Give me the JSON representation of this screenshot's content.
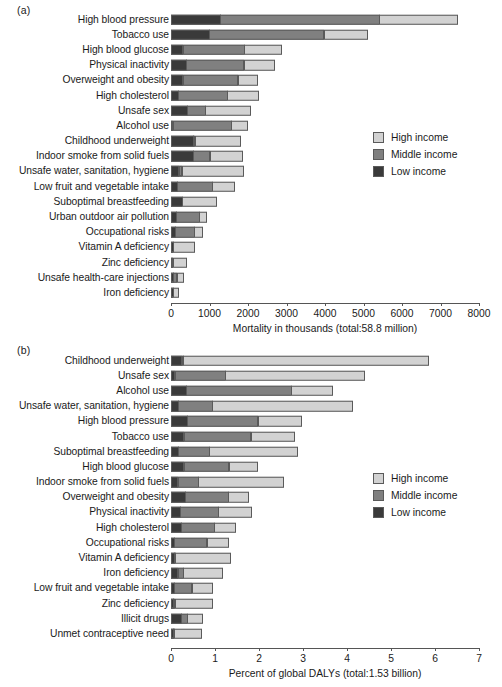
{
  "figure": {
    "panels": [
      {
        "letter": "(a)",
        "axis_title": "Mortality in thousands (total:58.8 million)",
        "xlim": [
          0,
          8000
        ],
        "ticks": [
          0,
          1000,
          2000,
          3000,
          4000,
          5000,
          6000,
          7000,
          8000
        ],
        "tick_labels": [
          "0",
          "1000",
          "2000",
          "3000",
          "4000",
          "5000",
          "6000",
          "7000",
          "8000"
        ]
      },
      {
        "letter": "(b)",
        "axis_title": "Percent of global DALYs (total:1.53 billion)",
        "xlim": [
          0,
          7
        ],
        "ticks": [
          0,
          1,
          2,
          3,
          4,
          5,
          6,
          7
        ],
        "tick_labels": [
          "0",
          "1",
          "2",
          "3",
          "4",
          "5",
          "6",
          "7"
        ]
      }
    ],
    "legend": {
      "entries": [
        {
          "label": "High income",
          "key": "high",
          "color": "#d2d2d2"
        },
        {
          "label": "Middle income",
          "key": "middle",
          "color": "#808080"
        },
        {
          "label": "Low income",
          "key": "low",
          "color": "#3a3a3a"
        }
      ]
    }
  },
  "chart_data": [
    {
      "type": "bar",
      "orientation": "horizontal",
      "stacked": true,
      "panel": "(a)",
      "title": "",
      "xlabel": "Mortality in thousands (total:58.8 million)",
      "ylabel": "",
      "xlim": [
        0,
        8000
      ],
      "xticks": [
        0,
        1000,
        2000,
        3000,
        4000,
        5000,
        6000,
        7000,
        8000
      ],
      "grid": false,
      "legend_position": "right",
      "series_order": [
        "Low income",
        "Middle income",
        "High income"
      ],
      "categories": [
        "High blood pressure",
        "Tobacco use",
        "High blood glucose",
        "Physical inactivity",
        "Overweight and obesity",
        "High cholesterol",
        "Unsafe sex",
        "Alcohol use",
        "Childhood underweight",
        "Indoor smoke from solid fuels",
        "Unsafe water, sanitation, hygiene",
        "Low fruit and vegetable intake",
        "Suboptimal breastfeeding",
        "Urban outdoor air pollution",
        "Occupational risks",
        "Vitamin A deficiency",
        "Zinc deficiency",
        "Unsafe health-care injections",
        "Iron deficiency"
      ],
      "series": [
        {
          "name": "Low income",
          "values": [
            1300,
            1000,
            320,
            420,
            320,
            200,
            430,
            60,
            600,
            600,
            220,
            180,
            300,
            150,
            130,
            70,
            60,
            80,
            70
          ]
        },
        {
          "name": "Middle income",
          "values": [
            4150,
            3000,
            1620,
            1500,
            1450,
            1300,
            500,
            1530,
            10,
            440,
            90,
            930,
            0,
            620,
            500,
            0,
            0,
            100,
            0
          ]
        },
        {
          "name": "High income",
          "values": [
            2050,
            1150,
            990,
            820,
            530,
            830,
            1180,
            450,
            1200,
            860,
            1630,
            580,
            920,
            200,
            230,
            560,
            370,
            190,
            150
          ]
        }
      ],
      "totals": [
        7500,
        5150,
        2930,
        2740,
        2300,
        2330,
        2110,
        2040,
        1810,
        1900,
        1940,
        1690,
        1220,
        970,
        860,
        630,
        430,
        370,
        220
      ]
    },
    {
      "type": "bar",
      "orientation": "horizontal",
      "stacked": true,
      "panel": "(b)",
      "title": "",
      "xlabel": "Percent of global DALYs (total:1.53 billion)",
      "ylabel": "",
      "xlim": [
        0,
        7
      ],
      "xticks": [
        0,
        1,
        2,
        3,
        4,
        5,
        6,
        7
      ],
      "grid": false,
      "legend_position": "right",
      "series_order": [
        "Low income",
        "Middle income",
        "High income"
      ],
      "categories": [
        "Childhood underweight",
        "Unsafe sex",
        "Alcohol use",
        "Unsafe water, sanitation, hygiene",
        "High blood pressure",
        "Tobacco use",
        "Suboptimal breastfeeding",
        "High blood glucose",
        "Indoor smoke from solid fuels",
        "Overweight and obesity",
        "Physical inactivity",
        "High cholesterol",
        "Occupational risks",
        "Vitamin A deficiency",
        "Iron deficiency",
        "Low fruit and vegetable intake",
        "Zinc deficiency",
        "Illicit drugs",
        "Unmet contraceptive need"
      ],
      "series": [
        {
          "name": "Low income",
          "values": [
            0.26,
            0.1,
            0.36,
            0.18,
            0.38,
            0.3,
            0.18,
            0.3,
            0.17,
            0.33,
            0.22,
            0.24,
            0.08,
            0.08,
            0.17,
            0.08,
            0.07,
            0.24,
            0.06
          ]
        },
        {
          "name": "Middle income",
          "values": [
            0.04,
            1.17,
            2.4,
            0.78,
            1.62,
            1.54,
            0.72,
            1.04,
            0.48,
            1.0,
            0.88,
            0.78,
            0.76,
            0.04,
            0.14,
            0.42,
            0.04,
            0.16,
            0.04
          ]
        },
        {
          "name": "High income",
          "values": [
            5.6,
            3.18,
            0.96,
            3.2,
            1.0,
            1.0,
            2.02,
            0.66,
            1.95,
            0.48,
            0.78,
            0.5,
            0.5,
            1.26,
            0.9,
            0.48,
            0.88,
            0.36,
            0.62
          ]
        }
      ],
      "totals": [
        5.9,
        4.45,
        3.72,
        4.16,
        3.0,
        2.84,
        2.92,
        2.0,
        2.6,
        1.81,
        1.88,
        1.52,
        1.34,
        1.38,
        1.21,
        0.98,
        0.99,
        0.76,
        0.72
      ]
    }
  ]
}
